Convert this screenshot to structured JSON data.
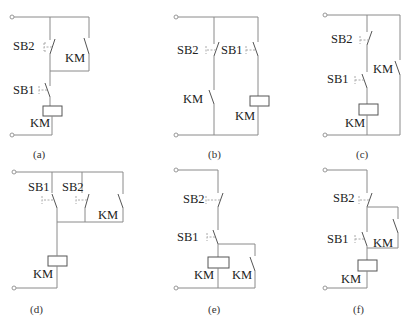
{
  "diagrams": {
    "a": {
      "caption": "(a)",
      "labels": {
        "sb2": "SB2",
        "km_contact": "KM",
        "sb1": "SB1",
        "km_coil": "KM"
      }
    },
    "b": {
      "caption": "(b)",
      "labels": {
        "sb2": "SB2",
        "sb1": "SB1",
        "km_contact": "KM",
        "km_coil": "KM"
      }
    },
    "c": {
      "caption": "(c)",
      "labels": {
        "sb2": "SB2",
        "sb1": "SB1",
        "km_contact": "KM",
        "km_coil": "KM"
      }
    },
    "d": {
      "caption": "(d)",
      "labels": {
        "sb1": "SB1",
        "sb2": "SB2",
        "km_contact": "KM",
        "km_coil": "KM"
      }
    },
    "e": {
      "caption": "(e)",
      "labels": {
        "sb2": "SB2",
        "sb1": "SB1",
        "km_coil": "KM",
        "km_contact": "KM"
      }
    },
    "f": {
      "caption": "(f)",
      "labels": {
        "sb2": "SB2",
        "sb1": "SB1",
        "km_contact": "KM",
        "km_coil": "KM"
      }
    }
  }
}
